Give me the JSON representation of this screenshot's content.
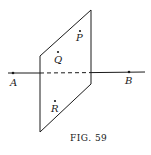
{
  "figure": {
    "caption": "Fig. 59",
    "caption_display": "FIG. 59"
  },
  "points": {
    "A": {
      "label": "A",
      "x": 13,
      "y": 73
    },
    "B": {
      "label": "B",
      "x": 129,
      "y": 72
    },
    "P": {
      "label": "P",
      "x": 80,
      "y": 31
    },
    "Q": {
      "label": "Q",
      "x": 58,
      "y": 52
    },
    "R": {
      "label": "R",
      "x": 55,
      "y": 101
    }
  },
  "plane": {
    "vertices": [
      [
        40,
        56
      ],
      [
        91,
        10
      ],
      [
        91,
        84
      ],
      [
        40,
        132
      ]
    ]
  },
  "line": {
    "from": [
      8,
      73
    ],
    "to": [
      145,
      72
    ],
    "hidden_segment": [
      40,
      91
    ]
  },
  "colors": {
    "ink": "#1a1a1a",
    "background": "#ffffff"
  }
}
